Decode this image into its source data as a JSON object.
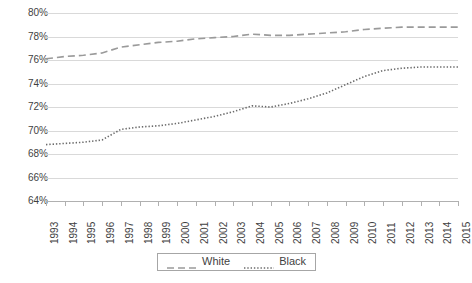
{
  "chart_data": {
    "type": "line",
    "title": "",
    "subtitle": "",
    "xlabel": "",
    "ylabel": "",
    "grid": true,
    "legend_position": "bottom",
    "ylim": [
      64,
      80
    ],
    "ytick_step": 2,
    "ytick_labels": [
      "80%",
      "78%",
      "76%",
      "74%",
      "72%",
      "70%",
      "68%",
      "66%",
      "64%"
    ],
    "ytick_values": [
      80,
      78,
      76,
      74,
      72,
      70,
      68,
      66,
      64
    ],
    "categories": [
      "1993",
      "1994",
      "1995",
      "1996",
      "1997",
      "1998",
      "1999",
      "2000",
      "2001",
      "2002",
      "2003",
      "2004",
      "2005",
      "2006",
      "2007",
      "2008",
      "2009",
      "2010",
      "2011",
      "2012",
      "2013",
      "2014",
      "2015"
    ],
    "series": [
      {
        "name": "White",
        "style": "dashed",
        "color": "#9a9a9a",
        "values": [
          76.1,
          76.3,
          76.4,
          76.6,
          77.1,
          77.3,
          77.5,
          77.6,
          77.8,
          77.9,
          78.0,
          78.2,
          78.1,
          78.1,
          78.2,
          78.3,
          78.4,
          78.6,
          78.7,
          78.8,
          78.8,
          78.8,
          78.8
        ]
      },
      {
        "name": "Black",
        "style": "dotted",
        "color": "#6b6b6b",
        "values": [
          68.8,
          68.9,
          69.0,
          69.2,
          70.1,
          70.3,
          70.4,
          70.6,
          70.9,
          71.2,
          71.6,
          72.1,
          72.0,
          72.3,
          72.7,
          73.2,
          73.9,
          74.6,
          75.1,
          75.3,
          75.4,
          75.4,
          75.4
        ]
      }
    ],
    "legend": [
      {
        "label": "White",
        "style": "dashed"
      },
      {
        "label": "Black",
        "style": "dotted"
      }
    ]
  }
}
